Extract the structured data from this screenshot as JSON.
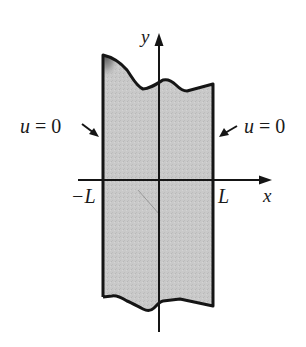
{
  "figure": {
    "type": "region diagram",
    "axes": {
      "x_label": "x",
      "y_label": "y"
    },
    "tick_labels": {
      "left": "−L",
      "right": "L"
    },
    "boundary_conditions": {
      "left": {
        "u": "u",
        "eq": "=",
        "value": "0",
        "text": "u = 0"
      },
      "right": {
        "u": "u",
        "eq": "=",
        "value": "0",
        "text": "u = 0"
      }
    },
    "colors": {
      "fill": "#c9c9c9",
      "fill_dark": "#6e6e6e",
      "stroke": "#151515",
      "background": "#ffffff"
    }
  }
}
